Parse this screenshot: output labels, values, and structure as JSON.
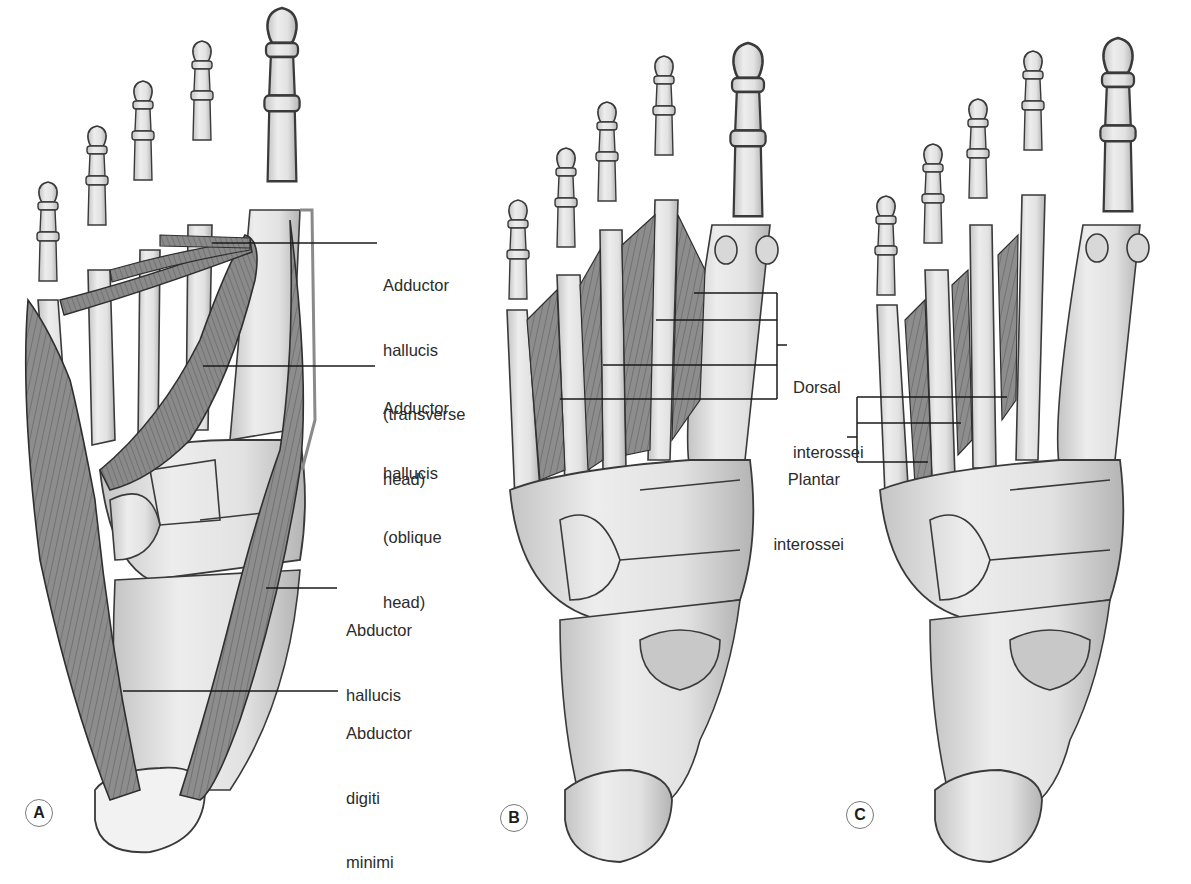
{
  "figure": {
    "panels": [
      {
        "id": "A",
        "label": "A",
        "view": "plantar muscles (adductor & abductors)"
      },
      {
        "id": "B",
        "label": "B",
        "view": "dorsal interossei"
      },
      {
        "id": "C",
        "label": "C",
        "view": "plantar interossei"
      }
    ],
    "labels": {
      "adductor_transverse": [
        "Adductor",
        "hallucis",
        "(transverse",
        "head)"
      ],
      "adductor_oblique": [
        "Adductor",
        "hallucis",
        "(oblique",
        "head)"
      ],
      "abductor_hallucis": [
        "Abductor",
        "hallucis"
      ],
      "abductor_digiti_minimi": [
        "Abductor",
        "digiti",
        "minimi"
      ],
      "dorsal_interossei": [
        "Dorsal",
        "interossei"
      ],
      "plantar_interossei": [
        "Plantar",
        "interossei"
      ]
    },
    "colors": {
      "bone_fill": "#e9e9e9",
      "bone_shade": "#b8b8b8",
      "outline": "#3a3a3a",
      "muscle": "#8a8a8a",
      "muscle_dark": "#5e5e5e",
      "leader_line": "#1a1a1a",
      "text": "#2b2b2b"
    }
  }
}
